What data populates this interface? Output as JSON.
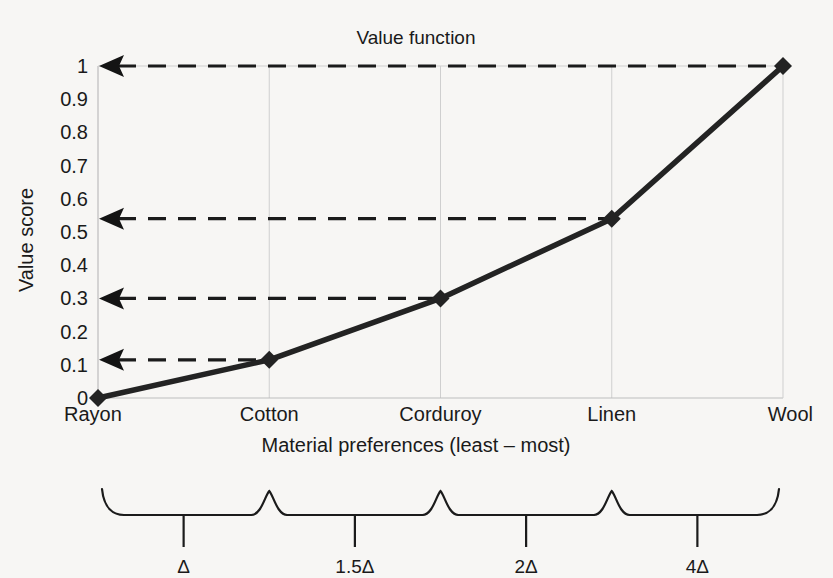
{
  "chart_data": {
    "type": "line",
    "title": "Value function",
    "xlabel": "Material preferences (least – most)",
    "ylabel": "Value score",
    "categories": [
      "Rayon",
      "Cotton",
      "Corduroy",
      "Linen",
      "Wool"
    ],
    "values": [
      0,
      0.115,
      0.3,
      0.54,
      1.0
    ],
    "ylim": [
      0,
      1
    ],
    "ytick_labels": [
      "0",
      "0.1",
      "0.2",
      "0.3",
      "0.4",
      "0.5",
      "0.6",
      "0.7",
      "0.8",
      "0.9",
      "1"
    ],
    "ytick_values": [
      0,
      0.1,
      0.2,
      0.3,
      0.4,
      0.5,
      0.6,
      0.7,
      0.8,
      0.9,
      1
    ],
    "grid": true,
    "legend": "none",
    "annotations": {
      "leader_lines": [
        {
          "label": "1",
          "value": 1.0,
          "from_category": "Wool"
        },
        {
          "label": "0.54",
          "value": 0.54,
          "from_category": "Linen"
        },
        {
          "label": "0.3",
          "value": 0.3,
          "from_category": "Corduroy"
        },
        {
          "label": "0.115",
          "value": 0.115,
          "from_category": "Cotton"
        }
      ],
      "interval_braces": [
        {
          "label": "Δ",
          "from": "Rayon",
          "to": "Cotton"
        },
        {
          "label": "1.5Δ",
          "from": "Cotton",
          "to": "Corduroy"
        },
        {
          "label": "2Δ",
          "from": "Corduroy",
          "to": "Linen"
        },
        {
          "label": "4Δ",
          "from": "Linen",
          "to": "Wool"
        }
      ]
    },
    "colors": {
      "series": "#232323",
      "grid": "#cfcfcf",
      "axis": "#bdbdbd",
      "annotation": "#1b1b1b",
      "background": "#f7f6f4"
    }
  }
}
